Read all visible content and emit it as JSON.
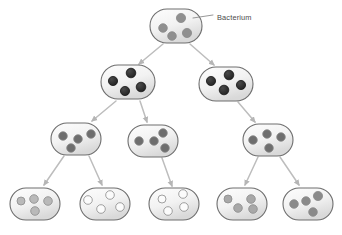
{
  "figure": {
    "background_color": "#ffffff",
    "annotation": {
      "label": "Bacterium",
      "label_color": "#4a4a4a",
      "leader_line_color": "#7d7d7d"
    },
    "style": {
      "cell_outline_color": "#6e6e6e",
      "cell_fill_light": "#f4f4f4",
      "cell_fill_dark": "#dcdcdc",
      "arrow_color": "#bdbdbd",
      "dot_outline_color": "#8a8a8a"
    },
    "dot_shades": {
      "generation_1": "#8f8f8f",
      "generation_2": "#2b2b2b",
      "generation_3": "#6e6e6e",
      "generation_4_light": "#b9b9b9",
      "generation_4_white": "#fbfbfb",
      "generation_4_mid": "#a8a8a8",
      "generation_4_dark": "#8a8a8a"
    },
    "generations": [
      {
        "generation": 1,
        "cell_count": 1,
        "cells": [
          {
            "id": "cell-g1-1",
            "cx": 176,
            "cy": 26,
            "rx": 26,
            "ry": 17,
            "dot_color": "#8f8f8f",
            "dot_count": 4,
            "dots": [
              {
                "x": 163,
                "y": 28,
                "r": 4.3
              },
              {
                "x": 181,
                "y": 18,
                "r": 4.6
              },
              {
                "x": 172,
                "y": 36,
                "r": 4.3
              },
              {
                "x": 187,
                "y": 33,
                "r": 4.6
              }
            ]
          }
        ]
      },
      {
        "generation": 2,
        "cell_count": 2,
        "cells": [
          {
            "id": "cell-g2-1",
            "cx": 128,
            "cy": 82,
            "rx": 27,
            "ry": 17,
            "dot_color": "#2b2b2b",
            "dot_count": 4,
            "dots": [
              {
                "x": 113,
                "y": 81,
                "r": 4.6
              },
              {
                "x": 131,
                "y": 73,
                "r": 4.8
              },
              {
                "x": 125,
                "y": 91,
                "r": 4.6
              },
              {
                "x": 141,
                "y": 87,
                "r": 4.8
              }
            ]
          },
          {
            "id": "cell-g2-2",
            "cx": 226,
            "cy": 84,
            "rx": 27,
            "ry": 17,
            "dot_color": "#2b2b2b",
            "dot_count": 4,
            "dots": [
              {
                "x": 211,
                "y": 81,
                "r": 4.6
              },
              {
                "x": 229,
                "y": 75,
                "r": 4.8
              },
              {
                "x": 224,
                "y": 90,
                "r": 4.8
              },
              {
                "x": 241,
                "y": 85,
                "r": 4.6
              }
            ]
          }
        ]
      },
      {
        "generation": 3,
        "cell_count": 3,
        "cells": [
          {
            "id": "cell-g3-1",
            "cx": 76,
            "cy": 139,
            "rx": 25,
            "ry": 16,
            "dot_color": "#6e6e6e",
            "dot_count": 4,
            "dots": [
              {
                "x": 63,
                "y": 136,
                "r": 4.3
              },
              {
                "x": 78,
                "y": 139,
                "r": 4.3
              },
              {
                "x": 91,
                "y": 134,
                "r": 4.3
              },
              {
                "x": 71,
                "y": 148,
                "r": 4.3
              }
            ]
          },
          {
            "id": "cell-g3-2",
            "cx": 153,
            "cy": 141,
            "rx": 25,
            "ry": 16,
            "dot_color": "#6e6e6e",
            "dot_count": 4,
            "dots": [
              {
                "x": 139,
                "y": 141,
                "r": 4.3
              },
              {
                "x": 154,
                "y": 141,
                "r": 4.3
              },
              {
                "x": 163,
                "y": 133,
                "r": 4.3
              },
              {
                "x": 165,
                "y": 148,
                "r": 4.3
              }
            ]
          },
          {
            "id": "cell-g3-3",
            "cx": 268,
            "cy": 140,
            "rx": 25,
            "ry": 16,
            "dot_color": "#6e6e6e",
            "dot_count": 4,
            "dots": [
              {
                "x": 253,
                "y": 140,
                "r": 4.3
              },
              {
                "x": 267,
                "y": 134,
                "r": 4.3
              },
              {
                "x": 281,
                "y": 137,
                "r": 4.3
              },
              {
                "x": 269,
                "y": 148,
                "r": 4.3
              }
            ]
          }
        ]
      },
      {
        "generation": 4,
        "cell_count": 5,
        "cells": [
          {
            "id": "cell-g4-1",
            "cx": 35,
            "cy": 204,
            "rx": 25,
            "ry": 16,
            "dot_color": "#b9b9b9",
            "dot_count": 4,
            "dots": [
              {
                "x": 21,
                "y": 201,
                "r": 4.0
              },
              {
                "x": 34,
                "y": 199,
                "r": 4.3
              },
              {
                "x": 48,
                "y": 201,
                "r": 4.3
              },
              {
                "x": 35,
                "y": 211,
                "r": 4.3
              }
            ]
          },
          {
            "id": "cell-g4-2",
            "cx": 105,
            "cy": 204,
            "rx": 25,
            "ry": 16,
            "dot_color": "#fbfbfb",
            "dot_count": 4,
            "dots": [
              {
                "x": 88,
                "y": 200,
                "r": 4.3
              },
              {
                "x": 110,
                "y": 195,
                "r": 4.3
              },
              {
                "x": 101,
                "y": 209,
                "r": 4.3
              },
              {
                "x": 120,
                "y": 207,
                "r": 4.3
              }
            ]
          },
          {
            "id": "cell-g4-3",
            "cx": 174,
            "cy": 204,
            "rx": 25,
            "ry": 16,
            "dot_color": "#fbfbfb",
            "dot_count": 4,
            "dots": [
              {
                "x": 162,
                "y": 199,
                "r": 4.0
              },
              {
                "x": 183,
                "y": 194,
                "r": 4.3
              },
              {
                "x": 168,
                "y": 211,
                "r": 4.3
              },
              {
                "x": 184,
                "y": 207,
                "r": 4.3
              }
            ]
          },
          {
            "id": "cell-g4-4",
            "cx": 242,
            "cy": 204,
            "rx": 25,
            "ry": 16,
            "dot_color": "#a8a8a8",
            "dot_count": 4,
            "dots": [
              {
                "x": 228,
                "y": 199,
                "r": 4.0
              },
              {
                "x": 238,
                "y": 208,
                "r": 4.3
              },
              {
                "x": 251,
                "y": 199,
                "r": 4.3
              },
              {
                "x": 253,
                "y": 209,
                "r": 4.3
              }
            ]
          },
          {
            "id": "cell-g4-5",
            "cx": 308,
            "cy": 204,
            "rx": 25,
            "ry": 16,
            "dot_color": "#8a8a8a",
            "dot_count": 4,
            "dots": [
              {
                "x": 294,
                "y": 204,
                "r": 4.3
              },
              {
                "x": 306,
                "y": 201,
                "r": 4.3
              },
              {
                "x": 318,
                "y": 196,
                "r": 4.6
              },
              {
                "x": 313,
                "y": 212,
                "r": 4.3
              }
            ]
          }
        ]
      }
    ],
    "arrows": [
      {
        "id": "arrow-g1-1-to-g2-1",
        "x1": 163,
        "y1": 44,
        "x2": 139,
        "y2": 64
      },
      {
        "id": "arrow-g1-1-to-g2-2",
        "x1": 190,
        "y1": 44,
        "x2": 214,
        "y2": 65
      },
      {
        "id": "arrow-g2-1-to-g3-1",
        "x1": 116,
        "y1": 101,
        "x2": 92,
        "y2": 121
      },
      {
        "id": "arrow-g2-1-to-g3-2",
        "x1": 140,
        "y1": 101,
        "x2": 147,
        "y2": 122
      },
      {
        "id": "arrow-g2-2-to-g3-3",
        "x1": 238,
        "y1": 102,
        "x2": 255,
        "y2": 122
      },
      {
        "id": "arrow-g3-1-to-g4-1",
        "x1": 64,
        "y1": 156,
        "x2": 44,
        "y2": 185
      },
      {
        "id": "arrow-g3-1-to-g4-2",
        "x1": 89,
        "y1": 156,
        "x2": 102,
        "y2": 185
      },
      {
        "id": "arrow-g3-2-to-g4-3",
        "x1": 162,
        "y1": 158,
        "x2": 172,
        "y2": 186
      },
      {
        "id": "arrow-g3-3-to-g4-4",
        "x1": 258,
        "y1": 157,
        "x2": 245,
        "y2": 185
      },
      {
        "id": "arrow-g3-3-to-g4-5",
        "x1": 280,
        "y1": 157,
        "x2": 299,
        "y2": 185
      }
    ],
    "leader": {
      "x1": 193,
      "y1": 18,
      "x2": 213,
      "y2": 15,
      "label_x": 217,
      "label_y": 18
    }
  }
}
